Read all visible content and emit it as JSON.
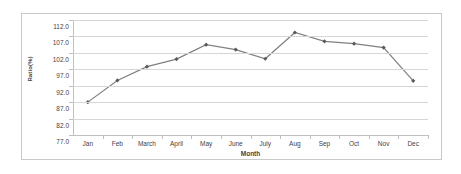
{
  "chart_data": {
    "type": "line",
    "title": "",
    "xlabel": "Month",
    "ylabel": "Ratio(%)",
    "categories": [
      "Jan",
      "Feb",
      "March",
      "April",
      "May",
      "June",
      "July",
      "Aug",
      "Sep",
      "Oct",
      "Nov",
      "Dec"
    ],
    "values": [
      87.0,
      93.6,
      97.8,
      100.1,
      104.5,
      103.0,
      100.2,
      108.2,
      105.5,
      104.8,
      103.6,
      93.5
    ],
    "series": [
      {
        "name": "Ratio(%)",
        "values": [
          87.0,
          93.6,
          97.8,
          100.1,
          104.5,
          103.0,
          100.2,
          108.2,
          105.5,
          104.8,
          103.6,
          93.5
        ]
      }
    ],
    "ylim": [
      77.0,
      112.0
    ],
    "ytick_step": 5.0,
    "ytick_labels": [
      "112.0",
      "107.0",
      "102.0",
      "97.0",
      "92.0",
      "87.0",
      "82.0",
      "77.0"
    ],
    "ytick_values": [
      112.0,
      107.0,
      102.0,
      97.0,
      92.0,
      87.0,
      82.0,
      77.0
    ],
    "grid": true,
    "legend": false,
    "legend_position": "none",
    "marker": "diamond",
    "line_color": "#808080",
    "marker_color": "#595959",
    "gridline_color": "#d6d6d6",
    "axis_color": "#bfbfbf",
    "text_color": "#3f3f3f",
    "plot_background": "#ffffff"
  }
}
